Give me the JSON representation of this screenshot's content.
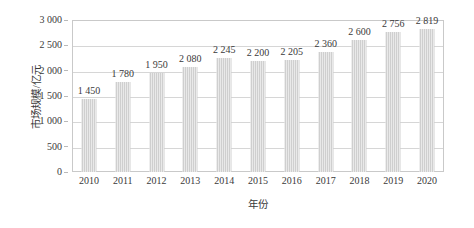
{
  "chart_data": {
    "type": "bar",
    "title": "",
    "subtitle": "",
    "xlabel": "年份",
    "ylabel": "市场规模/亿元",
    "categories": [
      "2010",
      "2011",
      "2012",
      "2013",
      "2014",
      "2015",
      "2016",
      "2017",
      "2018",
      "2019",
      "2020"
    ],
    "values": [
      1450,
      1780,
      1950,
      2080,
      2245,
      2200,
      2205,
      2360,
      2600,
      2756,
      2819
    ],
    "value_labels": [
      "1 450",
      "1 780",
      "1 950",
      "2 080",
      "2 245",
      "2 200",
      "2 205",
      "2 360",
      "2 600",
      "2 756",
      "2 819"
    ],
    "ylim": [
      0,
      3000
    ],
    "ytick_values": [
      0,
      500,
      1000,
      1500,
      2000,
      2500,
      3000
    ],
    "ytick_labels": [
      "0",
      "500",
      "1 000",
      "1 500",
      "2 000",
      "2 500",
      "3 000"
    ],
    "grid": "horizontal",
    "legend": "none",
    "bar_color": "#cfcfcf",
    "axis_color": "#c9c9c9",
    "grid_color": "#d6d6d6",
    "text_color": "#3a3a3a",
    "background_color": "#ffffff"
  }
}
